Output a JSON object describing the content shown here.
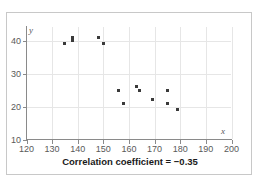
{
  "caption": "Correlation coefficient = −0.35",
  "colors": {
    "marker": "#3a3a3a",
    "gridline": "#e6e6e6",
    "axis": "#8a8a8a",
    "tick_text": "#595959",
    "caption_text": "#1a1a1a",
    "frame_border": "#c8c8c8",
    "background": "#ffffff"
  },
  "chart_data": {
    "type": "scatter",
    "title": "",
    "subtitle": "",
    "xlabel": "x",
    "ylabel": "y",
    "xlim": [
      120,
      200
    ],
    "ylim": [
      10,
      40
    ],
    "xticks": [
      120,
      130,
      140,
      150,
      160,
      170,
      180,
      190,
      200
    ],
    "yticks": [
      10,
      20,
      30,
      40
    ],
    "xtick_labels": [
      "120",
      "130",
      "140",
      "150",
      "160",
      "170",
      "180",
      "190",
      "200"
    ],
    "ytick_labels": [
      "10",
      "20",
      "30",
      "40"
    ],
    "grid": true,
    "grid_axis": "both",
    "legend": false,
    "legend_position": "none",
    "annotations": [
      "Correlation coefficient = −0.35"
    ],
    "correlation_coefficient": -0.35,
    "n_points": 13,
    "series": [
      {
        "name": "",
        "marker": "square",
        "points": [
          {
            "x": 135,
            "y": 39
          },
          {
            "x": 138,
            "y": 41
          },
          {
            "x": 138,
            "y": 40
          },
          {
            "x": 148,
            "y": 41
          },
          {
            "x": 150,
            "y": 39
          },
          {
            "x": 156,
            "y": 25
          },
          {
            "x": 158,
            "y": 21
          },
          {
            "x": 163,
            "y": 26
          },
          {
            "x": 164,
            "y": 25
          },
          {
            "x": 169,
            "y": 22
          },
          {
            "x": 175,
            "y": 25
          },
          {
            "x": 175,
            "y": 21
          },
          {
            "x": 179,
            "y": 19
          }
        ]
      }
    ]
  }
}
